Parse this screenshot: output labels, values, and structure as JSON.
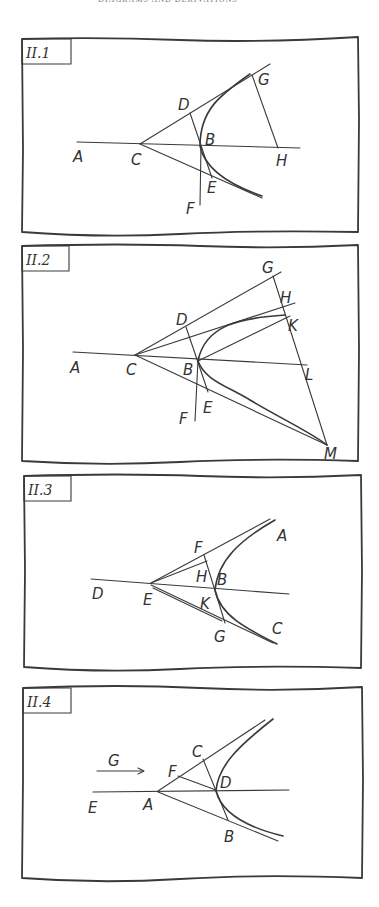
{
  "page": {
    "running_header": "DIAGRAMS AND DERIVATIONS",
    "background": "#ffffff",
    "ink_color": "#3a3a3a"
  },
  "panels": [
    {
      "id": "II.1",
      "tag": "II.1",
      "points": {
        "A": "A",
        "B": "B",
        "C": "C",
        "D": "D",
        "E": "E",
        "F": "F",
        "G": "G",
        "H": "H"
      }
    },
    {
      "id": "II.2",
      "tag": "II.2",
      "points": {
        "A": "A",
        "B": "B",
        "C": "C",
        "D": "D",
        "E": "E",
        "F": "F",
        "G": "G",
        "H": "H",
        "K": "K",
        "L": "L",
        "M": "M"
      }
    },
    {
      "id": "II.3",
      "tag": "II.3",
      "points": {
        "A": "A",
        "B": "B",
        "C": "C",
        "D": "D",
        "E": "E",
        "F": "F",
        "G": "G",
        "H": "H",
        "K": "K"
      }
    },
    {
      "id": "II.4",
      "tag": "II.4",
      "points": {
        "A": "A",
        "B": "B",
        "C": "C",
        "D": "D",
        "E": "E",
        "F": "F",
        "G": "G"
      },
      "arrow_label": "G"
    }
  ]
}
